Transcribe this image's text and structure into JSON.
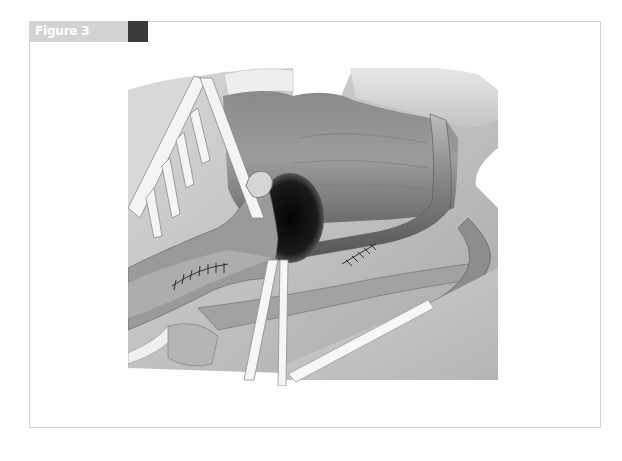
{
  "figure": {
    "label": "Figure 3",
    "header_color": "#d3d3d3",
    "accent_block_color": "#3a3a3a",
    "frame_border_color": "#d4d4d4"
  },
  "illustration": {
    "description": "Grayscale surgical illustration showing retracted tissue with vessels, a dark cavity, two sutured anastomoses and white retraction tapes",
    "elements": [
      "retractor",
      "cavity",
      "suture-line-left",
      "suture-line-right",
      "vessel-loop-tapes",
      "tube-vessel"
    ]
  }
}
